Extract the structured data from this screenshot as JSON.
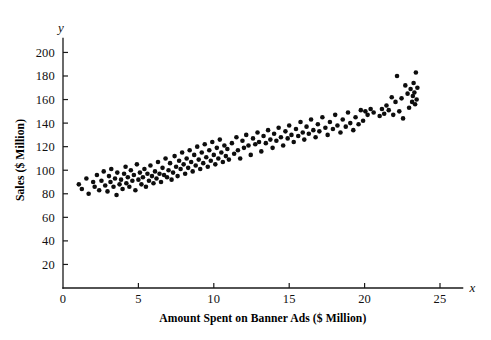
{
  "figure": {
    "background_color": "#ffffff",
    "point_color": "#0d0d0d",
    "axis_color": "#1a1a1a"
  },
  "axes": {
    "x_var_label": "x",
    "y_var_label": "y",
    "x_title": "Amount Spent on Banner Ads ($ Million)",
    "y_title": "Sales ($ Million)",
    "x_origin_label": "0"
  },
  "chart_data": {
    "type": "scatter",
    "title": "",
    "xlabel": "Amount Spent on Banner Ads ($ Million)",
    "ylabel": "Sales ($ Million)",
    "x_axis_symbol": "x",
    "y_axis_symbol": "y",
    "xlim": [
      0,
      26.5
    ],
    "ylim": [
      0,
      212
    ],
    "xticks": [
      0,
      5,
      10,
      15,
      20,
      25
    ],
    "xticklabels": [
      "0",
      "5",
      "10",
      "15",
      "20",
      "25"
    ],
    "yticks": [
      20,
      40,
      60,
      80,
      100,
      120,
      140,
      160,
      180,
      200
    ],
    "yticklabels": [
      "20",
      "40",
      "60",
      "80",
      "100",
      "120",
      "140",
      "160",
      "180",
      "200"
    ],
    "grid": false,
    "legend": false,
    "marker": "filled-circle",
    "marker_size_px": 4.6,
    "n_points": 182,
    "points": [
      [
        1.05,
        88
      ],
      [
        1.25,
        84
      ],
      [
        1.55,
        93
      ],
      [
        1.7,
        80
      ],
      [
        2.0,
        90
      ],
      [
        2.1,
        86
      ],
      [
        2.25,
        96
      ],
      [
        2.4,
        83
      ],
      [
        2.55,
        91
      ],
      [
        2.7,
        99
      ],
      [
        2.8,
        87
      ],
      [
        2.95,
        82
      ],
      [
        3.05,
        95
      ],
      [
        3.15,
        90
      ],
      [
        3.2,
        101
      ],
      [
        3.35,
        86
      ],
      [
        3.45,
        93
      ],
      [
        3.55,
        79
      ],
      [
        3.6,
        98
      ],
      [
        3.75,
        88
      ],
      [
        3.85,
        92
      ],
      [
        3.95,
        84
      ],
      [
        4.05,
        97
      ],
      [
        4.15,
        103
      ],
      [
        4.2,
        89
      ],
      [
        4.3,
        94
      ],
      [
        4.4,
        86
      ],
      [
        4.5,
        100
      ],
      [
        4.6,
        91
      ],
      [
        4.7,
        96
      ],
      [
        4.8,
        83
      ],
      [
        4.9,
        105
      ],
      [
        5.0,
        92
      ],
      [
        5.1,
        98
      ],
      [
        5.2,
        88
      ],
      [
        5.3,
        94
      ],
      [
        5.4,
        101
      ],
      [
        5.5,
        86
      ],
      [
        5.6,
        97
      ],
      [
        5.7,
        91
      ],
      [
        5.8,
        104
      ],
      [
        5.9,
        95
      ],
      [
        6.0,
        89
      ],
      [
        6.1,
        99
      ],
      [
        6.2,
        93
      ],
      [
        6.3,
        107
      ],
      [
        6.4,
        97
      ],
      [
        6.5,
        90
      ],
      [
        6.6,
        102
      ],
      [
        6.7,
        96
      ],
      [
        6.8,
        110
      ],
      [
        6.9,
        94
      ],
      [
        7.0,
        100
      ],
      [
        7.1,
        106
      ],
      [
        7.2,
        92
      ],
      [
        7.3,
        98
      ],
      [
        7.4,
        112
      ],
      [
        7.5,
        103
      ],
      [
        7.6,
        95
      ],
      [
        7.7,
        108
      ],
      [
        7.8,
        101
      ],
      [
        7.9,
        115
      ],
      [
        8.0,
        105
      ],
      [
        8.1,
        97
      ],
      [
        8.2,
        110
      ],
      [
        8.3,
        102
      ],
      [
        8.4,
        117
      ],
      [
        8.5,
        107
      ],
      [
        8.6,
        99
      ],
      [
        8.7,
        113
      ],
      [
        8.8,
        104
      ],
      [
        8.9,
        120
      ],
      [
        9.0,
        109
      ],
      [
        9.1,
        101
      ],
      [
        9.2,
        115
      ],
      [
        9.3,
        106
      ],
      [
        9.4,
        122
      ],
      [
        9.5,
        111
      ],
      [
        9.6,
        103
      ],
      [
        9.7,
        117
      ],
      [
        9.8,
        108
      ],
      [
        9.9,
        124
      ],
      [
        10.0,
        113
      ],
      [
        10.1,
        105
      ],
      [
        10.2,
        119
      ],
      [
        10.3,
        110
      ],
      [
        10.4,
        126
      ],
      [
        10.5,
        115
      ],
      [
        10.6,
        107
      ],
      [
        10.7,
        121
      ],
      [
        10.8,
        112
      ],
      [
        10.9,
        118
      ],
      [
        11.0,
        109
      ],
      [
        11.2,
        123
      ],
      [
        11.35,
        114
      ],
      [
        11.5,
        128
      ],
      [
        11.6,
        117
      ],
      [
        11.75,
        110
      ],
      [
        11.9,
        125
      ],
      [
        12.0,
        119
      ],
      [
        12.15,
        130
      ],
      [
        12.3,
        121
      ],
      [
        12.45,
        113
      ],
      [
        12.6,
        127
      ],
      [
        12.75,
        122
      ],
      [
        12.9,
        132
      ],
      [
        13.0,
        124
      ],
      [
        13.15,
        116
      ],
      [
        13.3,
        129
      ],
      [
        13.45,
        123
      ],
      [
        13.6,
        134
      ],
      [
        13.75,
        126
      ],
      [
        13.9,
        119
      ],
      [
        14.0,
        131
      ],
      [
        14.15,
        125
      ],
      [
        14.3,
        136
      ],
      [
        14.45,
        128
      ],
      [
        14.6,
        121
      ],
      [
        14.75,
        133
      ],
      [
        14.9,
        127
      ],
      [
        15.0,
        138
      ],
      [
        15.15,
        130
      ],
      [
        15.3,
        124
      ],
      [
        15.45,
        135
      ],
      [
        15.6,
        129
      ],
      [
        15.75,
        141
      ],
      [
        15.9,
        132
      ],
      [
        16.0,
        126
      ],
      [
        16.15,
        137
      ],
      [
        16.3,
        131
      ],
      [
        16.45,
        143
      ],
      [
        16.6,
        134
      ],
      [
        16.75,
        128
      ],
      [
        16.9,
        139
      ],
      [
        17.0,
        133
      ],
      [
        17.2,
        145
      ],
      [
        17.4,
        136
      ],
      [
        17.55,
        130
      ],
      [
        17.7,
        141
      ],
      [
        17.9,
        135
      ],
      [
        18.05,
        147
      ],
      [
        18.2,
        138
      ],
      [
        18.4,
        132
      ],
      [
        18.55,
        143
      ],
      [
        18.75,
        137
      ],
      [
        18.9,
        149
      ],
      [
        19.05,
        140
      ],
      [
        19.25,
        134
      ],
      [
        19.4,
        145
      ],
      [
        19.6,
        139
      ],
      [
        19.75,
        151
      ],
      [
        19.9,
        142
      ],
      [
        20.05,
        150
      ],
      [
        20.2,
        147
      ],
      [
        20.4,
        152
      ],
      [
        20.6,
        149
      ],
      [
        21.0,
        146
      ],
      [
        21.15,
        152
      ],
      [
        21.3,
        148
      ],
      [
        21.45,
        155
      ],
      [
        21.6,
        151
      ],
      [
        21.8,
        162
      ],
      [
        21.9,
        147
      ],
      [
        22.05,
        158
      ],
      [
        22.15,
        180
      ],
      [
        22.3,
        150
      ],
      [
        22.45,
        161
      ],
      [
        22.55,
        144
      ],
      [
        22.7,
        172
      ],
      [
        22.85,
        165
      ],
      [
        22.95,
        153
      ],
      [
        23.05,
        169
      ],
      [
        23.15,
        158
      ],
      [
        23.2,
        163
      ],
      [
        23.25,
        174
      ],
      [
        23.3,
        166
      ],
      [
        23.35,
        156
      ],
      [
        23.4,
        183
      ],
      [
        23.45,
        160
      ],
      [
        23.5,
        170
      ]
    ]
  }
}
